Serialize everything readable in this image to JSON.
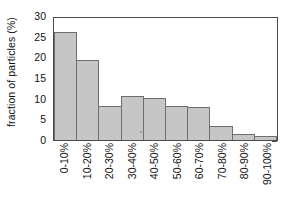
{
  "chart_data": {
    "type": "bar",
    "title": "",
    "xlabel": "",
    "ylabel": "fraction of particles (%)",
    "categories": [
      "0-10%",
      "10-20%",
      "20-30%",
      "30-40%",
      "40-50%",
      "50-60%",
      "60-70%",
      "70-80%",
      "80-90%",
      "90-100%"
    ],
    "values": [
      26.5,
      19.6,
      8.4,
      10.9,
      10.4,
      8.4,
      8.2,
      3.5,
      1.4,
      1.1
    ],
    "ylim": [
      0,
      30
    ],
    "ytick_labels": [
      "30",
      "25",
      "20",
      "15",
      "10",
      "5",
      "0"
    ],
    "ytick_values": [
      30,
      25,
      20,
      15,
      10,
      5,
      0
    ],
    "grid": false,
    "legend": false,
    "bar_fill_color": "#c6c6c6",
    "bar_edge_color": "#6e6e6e",
    "axis_color": "#4a4a4a",
    "background_color": "#ffffff"
  }
}
